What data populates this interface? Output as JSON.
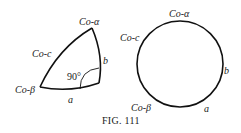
{
  "figure": {
    "caption": "Fig. 111",
    "caption_display": "FIG. 111"
  },
  "triangle": {
    "vertices": {
      "top": "Co-α",
      "left": "Co-c",
      "bottom_left": "Co-β"
    },
    "sides": {
      "right": "b",
      "bottom": "a"
    },
    "right_angle_label": "90°"
  },
  "circle": {
    "labels": {
      "top": "Co-α",
      "left": "Co-c",
      "right": "b",
      "bottom_left": "Co-β",
      "bottom_right": "a"
    }
  }
}
